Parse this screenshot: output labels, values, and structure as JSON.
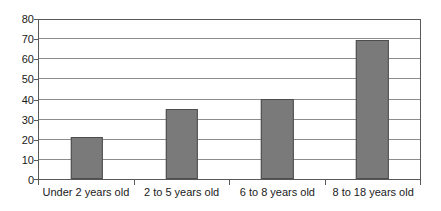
{
  "chart_data": {
    "type": "bar",
    "title": "",
    "subtitle": "",
    "xlabel": "",
    "ylabel": "",
    "categories": [
      "Under 2 years old",
      "2 to 5 years old",
      "6 to 8 years old",
      "8 to 18 years old"
    ],
    "values": [
      21,
      35,
      40,
      70
    ],
    "ylim": [
      0,
      80
    ],
    "ytick_step": 10,
    "yticks": [
      0,
      10,
      20,
      30,
      40,
      50,
      60,
      70,
      80
    ],
    "ytick_labels": [
      "0",
      "10",
      "20",
      "30",
      "40",
      "50",
      "60",
      "70",
      "80"
    ],
    "grid": "horizontal",
    "legend": "none",
    "bar_color": "#7a7a7a",
    "bar_border_color": "#4d4d4d",
    "gridline_color": "#8c8c8c",
    "frame_color": "#595959",
    "background_color": "#ffffff",
    "text_color": "#1a1a1a"
  }
}
